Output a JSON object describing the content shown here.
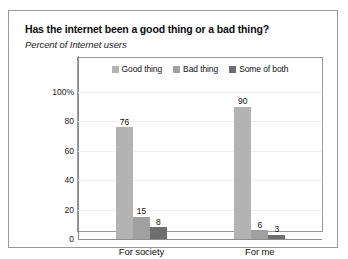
{
  "chart_data": {
    "type": "bar",
    "title": "Has the internet been a good thing or a bad thing?",
    "subtitle": "Percent of Internet users",
    "xlabel": "",
    "ylabel": "",
    "ylim": [
      0,
      100
    ],
    "yticks": [
      "100%",
      "80",
      "60",
      "40",
      "20",
      "0"
    ],
    "ytick_values": [
      100,
      80,
      60,
      40,
      20,
      0
    ],
    "grid": true,
    "legend_position": "top-center",
    "categories": [
      "For society",
      "For me"
    ],
    "series": [
      {
        "name": "Good thing",
        "color": "#b3b3b3",
        "values": [
          76,
          90
        ]
      },
      {
        "name": "Bad thing",
        "color": "#a0a0a0",
        "values": [
          15,
          6
        ]
      },
      {
        "name": "Some of both",
        "color": "#6e6e6e",
        "values": [
          8,
          3
        ]
      }
    ]
  }
}
